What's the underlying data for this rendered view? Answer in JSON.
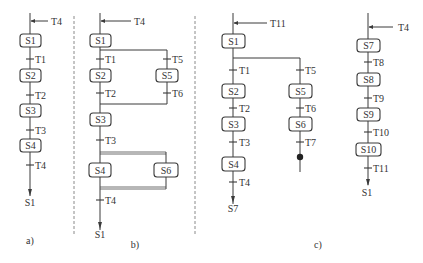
{
  "captions": {
    "a": "a)",
    "b": "b)",
    "c": "c)"
  },
  "diagram_a": {
    "entry": "T4",
    "steps": [
      "S1",
      "S2",
      "S3",
      "S4"
    ],
    "transitions": [
      "T1",
      "T2",
      "T3",
      "T4"
    ],
    "exit": "S1"
  },
  "diagram_b": {
    "entry": "T4",
    "steps": {
      "s1": "S1",
      "s2": "S2",
      "s3": "S3",
      "s4": "S4",
      "s5": "S5",
      "s6": "S6"
    },
    "transitions": {
      "t1": "T1",
      "t2": "T2",
      "t3": "T3",
      "t4": "T4",
      "t5": "T5",
      "t6": "T6"
    },
    "exit": "S1"
  },
  "diagram_c_main": {
    "entry": "T11",
    "steps": {
      "s1": "S1",
      "s2": "S2",
      "s3": "S3",
      "s4": "S4",
      "s5": "S5",
      "s6": "S6"
    },
    "transitions": {
      "t1": "T1",
      "t2": "T2",
      "t3": "T3",
      "t4": "T4",
      "t5": "T5",
      "t6": "T6",
      "t7": "T7"
    },
    "exit": "S7"
  },
  "diagram_c_sub": {
    "entry": "T4",
    "steps": [
      "S7",
      "S8",
      "S9",
      "S10"
    ],
    "transitions": [
      "T8",
      "T9",
      "T10",
      "T11"
    ],
    "exit": "S1"
  }
}
